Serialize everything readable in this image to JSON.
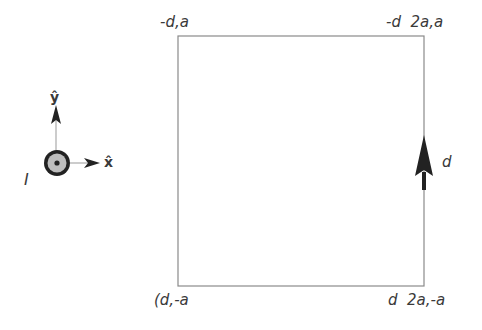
{
  "diagram": {
    "type": "current-loop-geometry",
    "square": {
      "x": 178,
      "y": 36,
      "width": 246,
      "height": 250,
      "stroke": "#8a8a8a"
    },
    "corner_labels": {
      "top_left": "-d,a",
      "top_right": "-d  2a,a",
      "bottom_left": "(d,-a",
      "bottom_right": "d  2a,-a"
    },
    "segment_label": "d",
    "current_label": "I",
    "axes": {
      "x_label": "x̂",
      "y_label": "ŷ"
    },
    "colors": {
      "line": "#8a8a8a",
      "arrow": "#222222",
      "wire_fill": "#b8b8b8",
      "text": "#3a3a3a"
    }
  }
}
